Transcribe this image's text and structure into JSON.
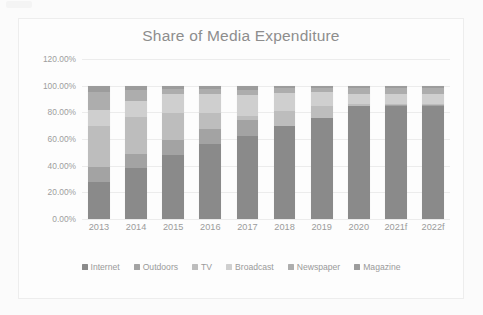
{
  "chart_data": {
    "type": "bar",
    "subtype": "100% stacked column",
    "title": "Share of Media Expenditure",
    "xlabel": "",
    "ylabel": "",
    "ylim": [
      0,
      120
    ],
    "ytick_labels": [
      "120.00%",
      "100.00%",
      "80.00%",
      "60.00%",
      "40.00%",
      "20.00%",
      "0.00%"
    ],
    "ytick_values": [
      120,
      100,
      80,
      60,
      40,
      20,
      0
    ],
    "grid": true,
    "legend_position": "bottom",
    "categories": [
      "2013",
      "2014",
      "2015",
      "2016",
      "2017",
      "2018",
      "2019",
      "2020",
      "2021f",
      "2022f"
    ],
    "series": [
      {
        "name": "Internet",
        "color": "#8a8a8a",
        "values": [
          28.0,
          38.0,
          48.0,
          56.0,
          62.5,
          69.5,
          75.5,
          84.5,
          85.0,
          85.0
        ]
      },
      {
        "name": "Outdoors",
        "color": "#a3a3a3",
        "values": [
          11.0,
          11.0,
          11.5,
          11.5,
          12.0,
          0.5,
          0.5,
          0.5,
          0.5,
          0.5
        ]
      },
      {
        "name": "TV",
        "color": "#bdbdbd",
        "values": [
          31.0,
          27.5,
          20.0,
          12.0,
          2.5,
          11.0,
          9.0,
          1.0,
          1.0,
          1.0
        ]
      },
      {
        "name": "Broadcast",
        "color": "#cfcfcf",
        "values": [
          11.5,
          12.0,
          14.5,
          14.5,
          16.0,
          13.5,
          10.5,
          7.5,
          7.5,
          7.0
        ]
      },
      {
        "name": "Newspaper",
        "color": "#adadad",
        "values": [
          13.5,
          8.0,
          3.5,
          3.5,
          4.0,
          3.5,
          2.5,
          4.5,
          4.0,
          4.5
        ]
      },
      {
        "name": "Magazine",
        "color": "#9c9c9c",
        "values": [
          5.0,
          3.5,
          2.5,
          2.5,
          3.0,
          2.0,
          2.0,
          2.0,
          2.0,
          2.0
        ]
      }
    ]
  },
  "legend": {
    "items": [
      {
        "label": "Internet"
      },
      {
        "label": "Outdoors"
      },
      {
        "label": "TV"
      },
      {
        "label": "Broadcast"
      },
      {
        "label": "Newspaper"
      },
      {
        "label": "Magazine"
      }
    ]
  }
}
